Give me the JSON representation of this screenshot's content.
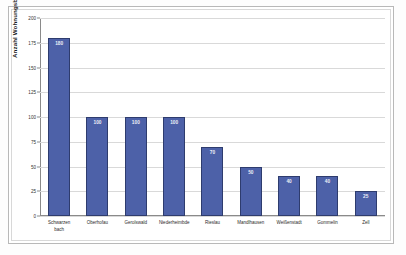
{
  "chart_data": {
    "type": "bar",
    "title": "",
    "xlabel": "",
    "ylabel": "Anzahl Wohnungsbestände",
    "ylim": [
      0,
      200
    ],
    "yticks": [
      0,
      25,
      50,
      75,
      100,
      125,
      150,
      175,
      200
    ],
    "ytick_labels": [
      "0",
      "25",
      "50",
      "75",
      "100",
      "125",
      "150",
      "175",
      "200"
    ],
    "grid": true,
    "legend": false,
    "bar_color": "#4d61a8",
    "bar_edge_color": "#2e3c6e",
    "value_label_color": "#eceff7",
    "categories": [
      "Schwarzenbach",
      "Oberhofau",
      "Gerolswald",
      "Niederheimbde",
      "Rieslau",
      "Mandlhausen",
      "Weißenstadt",
      "Gommelin",
      "Zell"
    ],
    "category_lines": [
      [
        "Schwarzen",
        "bach"
      ],
      [
        "Oberhofau"
      ],
      [
        "Gerolswald"
      ],
      [
        "Niederheimbde"
      ],
      [
        "Rieslau"
      ],
      [
        "Mandlhausen"
      ],
      [
        "Weißenstadt"
      ],
      [
        "Gommelin"
      ],
      [
        "Zell"
      ]
    ],
    "values": [
      180,
      100,
      100,
      100,
      70,
      50,
      40,
      40,
      25
    ],
    "value_labels": [
      "180",
      "100",
      "100",
      "100",
      "70",
      "50",
      "40",
      "40",
      "25"
    ]
  }
}
